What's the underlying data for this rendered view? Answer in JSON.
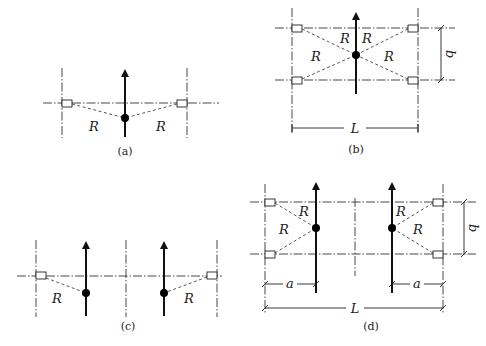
{
  "figure": {
    "panels": [
      {
        "id": "a",
        "caption": "(a)",
        "labels": [
          "R",
          "R"
        ]
      },
      {
        "id": "b",
        "caption": "(b)",
        "labels": [
          "R",
          "R",
          "R",
          "R"
        ],
        "dimensions": {
          "length": "L",
          "width": "b"
        }
      },
      {
        "id": "c",
        "caption": "(c)",
        "labels": [
          "R",
          "R"
        ]
      },
      {
        "id": "d",
        "caption": "(d)",
        "labels": [
          "R",
          "R",
          "R",
          "R"
        ],
        "dimensions": {
          "length": "L",
          "width": "b",
          "offset_left": "a",
          "offset_right": "a"
        }
      }
    ]
  }
}
